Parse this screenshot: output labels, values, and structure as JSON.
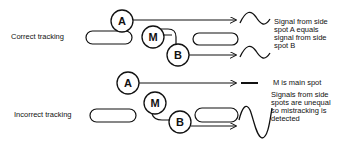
{
  "sections": {
    "correct": {
      "label": "Correct tracking",
      "spots": {
        "a": "A",
        "m": "M",
        "b": "B"
      },
      "caption": [
        "Signal from side",
        "spot A equals",
        "signal from side",
        "spot B"
      ]
    },
    "incorrect": {
      "label": "Incorrect tracking",
      "spots": {
        "a": "A",
        "m": "M",
        "b": "B"
      },
      "main_caption": "M is main spot",
      "caption": [
        "Signals from side",
        "spots are unequal",
        "so mistracking is",
        "detected"
      ]
    }
  },
  "colors": {
    "line": "#111111",
    "background": "#ffffff"
  }
}
